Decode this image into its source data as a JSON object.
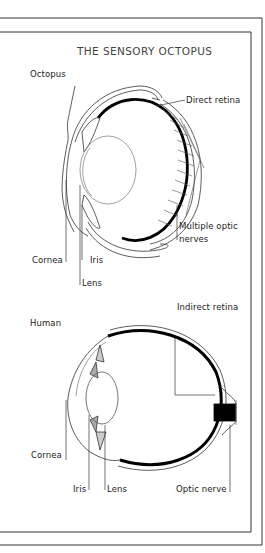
{
  "title": "THE SENSORY OCTOPUS",
  "octopus": {
    "heading": "Octopus",
    "labels": {
      "direct_retina": "Direct retina",
      "multiple_optic_line1": "Multiple optic",
      "multiple_optic_line2": "nerves",
      "cornea": "Cornea",
      "iris": "Iris",
      "lens": "Lens"
    }
  },
  "human": {
    "heading": "Human",
    "labels": {
      "indirect_retina": "Indirect retina",
      "cornea": "Cornea",
      "iris": "Iris",
      "lens": "Lens",
      "optic_nerve": "Optic nerve"
    }
  }
}
